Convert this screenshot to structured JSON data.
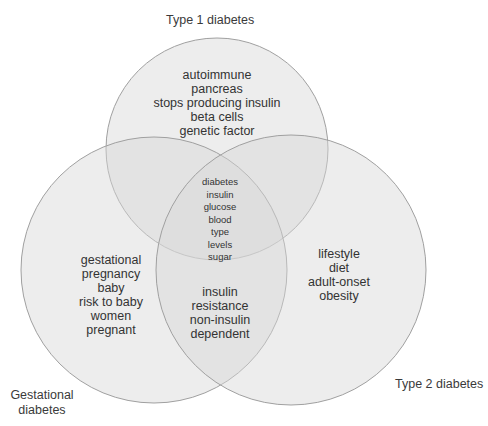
{
  "diagram": {
    "type": "venn",
    "colors": {
      "fill": "#d8d8d8",
      "stroke": "#9a9a9a",
      "text": "#333333"
    },
    "sets": [
      {
        "label": "Type 1 diabetes"
      },
      {
        "label": "Gestational diabetes",
        "label_lines": [
          "Gestational",
          "diabetes"
        ]
      },
      {
        "label": "Type 2 diabetes"
      }
    ],
    "regions": {
      "type1_only": [
        "autoimmune",
        "pancreas",
        "stops producing insulin",
        "beta cells",
        "genetic factor"
      ],
      "gestational_only": [
        "gestational",
        "pregnancy",
        "baby",
        "risk to baby",
        "women",
        "pregnant"
      ],
      "type2_only": [
        "lifestyle",
        "diet",
        "adult-onset",
        "obesity"
      ],
      "all_three": [
        "diabetes",
        "insulin",
        "glucose",
        "blood",
        "type",
        "levels",
        "sugar"
      ],
      "gestational_and_type2": [
        "insulin",
        "resistance",
        "non-insulin",
        "dependent"
      ]
    }
  }
}
